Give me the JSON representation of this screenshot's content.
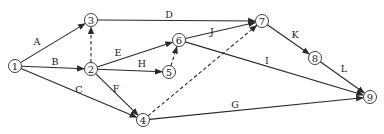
{
  "diagram": {
    "type": "activity-on-arrow network",
    "nodes": [
      {
        "id": "1",
        "x": 15,
        "y": 66
      },
      {
        "id": "2",
        "x": 91,
        "y": 69
      },
      {
        "id": "3",
        "x": 91,
        "y": 20
      },
      {
        "id": "4",
        "x": 143,
        "y": 120
      },
      {
        "id": "5",
        "x": 169,
        "y": 72
      },
      {
        "id": "6",
        "x": 179,
        "y": 40
      },
      {
        "id": "7",
        "x": 262,
        "y": 21
      },
      {
        "id": "8",
        "x": 315,
        "y": 58
      },
      {
        "id": "9",
        "x": 370,
        "y": 97
      }
    ],
    "activities": [
      {
        "label": "A",
        "from": "1",
        "to": "3",
        "dummy": false,
        "lx": 37,
        "ly": 41
      },
      {
        "label": "B",
        "from": "1",
        "to": "2",
        "dummy": false,
        "lx": 55,
        "ly": 61
      },
      {
        "label": "C",
        "from": "1",
        "to": "4",
        "dummy": false,
        "lx": 79,
        "ly": 89
      },
      {
        "label": "D",
        "from": "3",
        "to": "7",
        "dummy": false,
        "lx": 169,
        "ly": 14
      },
      {
        "label": "E",
        "from": "2",
        "to": "6",
        "dummy": false,
        "lx": 118,
        "ly": 52
      },
      {
        "label": "F",
        "from": "2",
        "to": "4",
        "dummy": false,
        "lx": 116,
        "ly": 88
      },
      {
        "label": "G",
        "from": "4",
        "to": "9",
        "dummy": false,
        "lx": 235,
        "ly": 104
      },
      {
        "label": "H",
        "from": "2",
        "to": "5",
        "dummy": false,
        "lx": 142,
        "ly": 63
      },
      {
        "label": "I",
        "from": "6",
        "to": "9",
        "dummy": false,
        "lx": 267,
        "ly": 60
      },
      {
        "label": "J",
        "from": "6",
        "to": "7",
        "dummy": false,
        "lx": 212,
        "ly": 31
      },
      {
        "label": "K",
        "from": "7",
        "to": "8",
        "dummy": false,
        "lx": 295,
        "ly": 34
      },
      {
        "label": "L",
        "from": "8",
        "to": "9",
        "dummy": false,
        "lx": 344,
        "ly": 68
      },
      {
        "label": "",
        "from": "2",
        "to": "3",
        "dummy": true
      },
      {
        "label": "",
        "from": "5",
        "to": "6",
        "dummy": true
      },
      {
        "label": "",
        "from": "4",
        "to": "7",
        "dummy": true
      }
    ]
  }
}
